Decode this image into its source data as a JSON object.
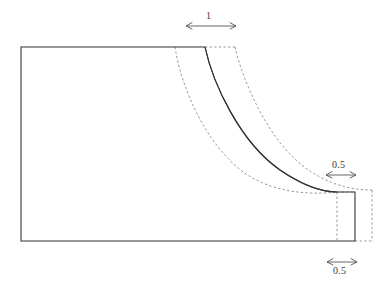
{
  "figure": {
    "type": "engineering-section-diagram",
    "background_color": "#ffffff",
    "solid_line_color": "#333333",
    "dashed_line_color": "#9a9a9a",
    "dimension_line_color": "#555555"
  },
  "dimensions": [
    {
      "id": "top-width",
      "value": "1",
      "label_position": "above",
      "orientation": "horizontal",
      "x1": 186,
      "x2": 236,
      "y": 26,
      "label_x": 206,
      "label_y": 11
    },
    {
      "id": "upper-right-width",
      "value": "0.5",
      "label_position": "above",
      "orientation": "horizontal",
      "x1": 326,
      "x2": 356,
      "y": 175,
      "label_x": 332,
      "label_y": 160
    },
    {
      "id": "lower-right-width",
      "value": "0.5",
      "label_position": "below",
      "orientation": "horizontal",
      "x1": 327,
      "x2": 357,
      "y": 262,
      "label_x": 333,
      "label_y": 266
    }
  ],
  "geometry": {
    "outline_solid": "M 21 47 L 205 47 C 213 84, 240 142, 280 170 C 305 187, 325 192, 337 192 L 355 192 L 355 241 L 21 241 Z",
    "curve_solid": "M 205 47 C 213 84, 240 142, 280 170 C 305 187, 325 192, 337 192",
    "curve_dashed_inner": "M 175 47 C 181 86, 205 145, 246 174 C 279 196, 320 194, 337 192",
    "curve_dashed_outer": "M 235 47 C 243 82, 268 139, 303 166 C 325 183, 348 190, 372 190",
    "top_dashed_edge": "M 205 47 L 236 47",
    "step_dashed_rect": "M 337 192 L 337 241 M 372 190 L 372 241 M 355 241 L 372 241 M 337 192 L 355 192"
  },
  "annotations": {
    "curve_count": 3,
    "curve_styles": [
      "dashed",
      "solid",
      "dashed"
    ]
  }
}
